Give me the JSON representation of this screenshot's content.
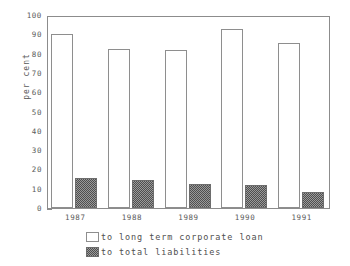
{
  "chart_data": {
    "type": "bar",
    "title": "",
    "subtitle": "",
    "xlabel": "",
    "ylabel": "per cent",
    "ylim": [
      0,
      100
    ],
    "ytick_step": 10,
    "yticks": [
      0,
      10,
      20,
      30,
      40,
      50,
      60,
      70,
      80,
      90,
      100
    ],
    "ytick_labels": [
      "0",
      "10",
      "20",
      "30",
      "40",
      "50",
      "60",
      "70",
      "80",
      "90",
      "100"
    ],
    "categories": [
      "1987",
      "1988",
      "1989",
      "1990",
      "1991"
    ],
    "grid": false,
    "legend_position": "bottom-left",
    "series": [
      {
        "name": "to long term corporate loan",
        "style": "white-outline",
        "color": "#ffffff",
        "edge_color": "#8e8e8e",
        "values": [
          90,
          82.5,
          82,
          93,
          85.5
        ]
      },
      {
        "name": "to total liabilities",
        "style": "dark-checker",
        "color": "#4f4f4f",
        "edge_color": "#6d6d6d",
        "values": [
          15.5,
          14.5,
          12.5,
          12,
          8.5
        ]
      }
    ],
    "annotations": []
  },
  "legend": {
    "items": [
      {
        "label": "to long term corporate loan",
        "swatch": "white-outline-swatch"
      },
      {
        "label": "to total liabilities",
        "swatch": "dark-checker-swatch"
      }
    ]
  },
  "axes": {
    "y_title": "per cent"
  },
  "colors": {
    "frame": "#8c8c8c",
    "text": "#5a5a5a",
    "bar_light": "#ffffff",
    "bar_dark": "#4f4f4f",
    "background": "#ffffff"
  }
}
